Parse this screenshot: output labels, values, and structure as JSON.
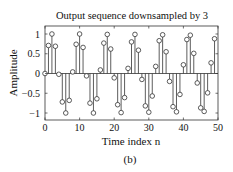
{
  "figure": {
    "caption": "(b)"
  },
  "chart_data": {
    "type": "stem",
    "title": "Output sequence downsampled by 3",
    "xlabel": "Time index n",
    "ylabel": "Amplitude",
    "xlim": [
      0,
      50
    ],
    "ylim": [
      -1.2,
      1.2
    ],
    "xticks": [
      0,
      10,
      20,
      30,
      40,
      50
    ],
    "xtick_labels": [
      "0",
      "10",
      "20",
      "30",
      "40",
      "50"
    ],
    "yticks": [
      1,
      0.5,
      0,
      -0.5,
      -1
    ],
    "ytick_labels": [
      "1",
      "0.5",
      "0",
      "−0.5",
      "−1"
    ],
    "grid": false,
    "legend": null,
    "marker": "open-circle",
    "line_color": "#333333",
    "baseline": 0,
    "x": [
      0,
      1,
      2,
      3,
      4,
      5,
      6,
      7,
      8,
      9,
      10,
      11,
      12,
      13,
      14,
      15,
      16,
      17,
      18,
      19,
      20,
      21,
      22,
      23,
      24,
      25,
      26,
      27,
      28,
      29,
      30,
      31,
      32,
      33,
      34,
      35,
      36,
      37,
      38,
      39,
      40,
      41,
      42,
      43,
      44,
      45,
      46,
      47,
      48,
      49
    ],
    "values": [
      0,
      0.71,
      1.0,
      0.69,
      -0.02,
      -0.72,
      -1.0,
      -0.68,
      0.04,
      0.74,
      1.0,
      0.66,
      -0.06,
      -0.75,
      -1.0,
      -0.64,
      0.09,
      0.77,
      0.99,
      0.62,
      -0.11,
      -0.79,
      -0.99,
      -0.61,
      0.13,
      0.8,
      0.99,
      0.59,
      -0.15,
      -0.82,
      -0.98,
      -0.57,
      0.18,
      0.83,
      0.98,
      0.55,
      -0.2,
      -0.84,
      -0.97,
      -0.53,
      0.22,
      0.86,
      0.97,
      0.51,
      -0.24,
      -0.87,
      -0.96,
      -0.49,
      0.27,
      0.88
    ]
  }
}
